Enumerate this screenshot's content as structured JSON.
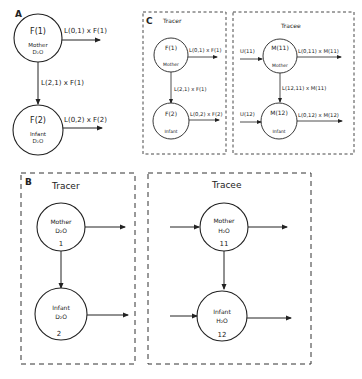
{
  "panelA": {
    "letter": "A",
    "nodes": [
      {
        "main": "F(1)",
        "sub1": "Mother",
        "sub2": "D₂O"
      },
      {
        "main": "F(2)",
        "sub1": "Infant",
        "sub2": "D₂O"
      }
    ],
    "flows": {
      "out1": "L(0,1) x F(1)",
      "transfer": "L(2,1) x F(1)",
      "out2": "L(0,2) x F(2)"
    }
  },
  "panelB": {
    "letter": "B",
    "tracer": {
      "title": "Tracer",
      "nodes": [
        {
          "name": "Mother",
          "formula": "D₂O",
          "num": "1"
        },
        {
          "name": "Infant",
          "formula": "D₂O",
          "num": "2"
        }
      ]
    },
    "tracee": {
      "title": "Tracee",
      "nodes": [
        {
          "name": "Mother",
          "formula": "H₂O",
          "num": "11"
        },
        {
          "name": "Infant",
          "formula": "H₂O",
          "num": "12"
        }
      ]
    }
  },
  "panelC": {
    "letter": "C",
    "tracer": {
      "title": "Tracer",
      "nodes": [
        {
          "main": "F(1)",
          "sub": "Mother"
        },
        {
          "main": "F(2)",
          "sub": "Infant"
        }
      ],
      "flows": {
        "out1": "L(0,1) x F(1)",
        "transfer": "L(2,1) x F(1)",
        "out2": "L(0,2) x F(2)"
      }
    },
    "tracee": {
      "title": "Tracee",
      "nodes": [
        {
          "main": "M(11)",
          "sub": "Mother"
        },
        {
          "main": "M(12)",
          "sub": "Infant"
        }
      ],
      "flows": {
        "in1": "U(11)",
        "out1": "L(0,11) x M(11)",
        "transfer": "L(12,11) x M(11)",
        "in2": "U(12)",
        "out2": "L(0,12) x M(12)"
      }
    }
  }
}
